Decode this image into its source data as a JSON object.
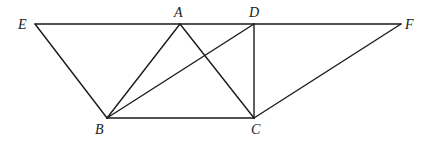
{
  "diagram": {
    "type": "geometry",
    "points": {
      "E": {
        "label": "E",
        "x": 35,
        "y": 24,
        "lx": 18,
        "ly": 29
      },
      "A": {
        "label": "A",
        "x": 180,
        "y": 24,
        "lx": 174,
        "ly": 17
      },
      "D": {
        "label": "D",
        "x": 254,
        "y": 24,
        "lx": 249,
        "ly": 17
      },
      "F": {
        "label": "F",
        "x": 401,
        "y": 24,
        "lx": 405,
        "ly": 29
      },
      "B": {
        "label": "B",
        "x": 107,
        "y": 118,
        "lx": 95,
        "ly": 134
      },
      "C": {
        "label": "C",
        "x": 254,
        "y": 118,
        "lx": 251,
        "ly": 134
      }
    },
    "segments": [
      {
        "name": "EF",
        "from": "E",
        "to": "F"
      },
      {
        "name": "EB",
        "from": "E",
        "to": "B"
      },
      {
        "name": "BC",
        "from": "B",
        "to": "C"
      },
      {
        "name": "CF",
        "from": "C",
        "to": "F"
      },
      {
        "name": "AB",
        "from": "A",
        "to": "B"
      },
      {
        "name": "AC",
        "from": "A",
        "to": "C"
      },
      {
        "name": "BD",
        "from": "B",
        "to": "D"
      },
      {
        "name": "DC",
        "from": "D",
        "to": "C"
      }
    ],
    "stroke_color": "#1a1a1a"
  }
}
